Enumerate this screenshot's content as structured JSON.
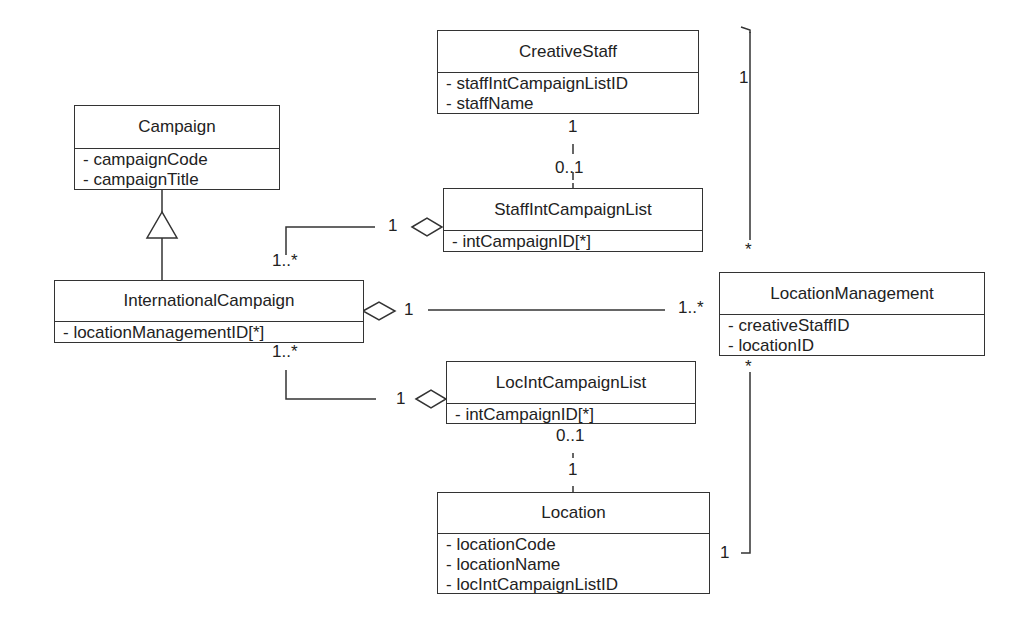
{
  "diagram": {
    "type": "UML class diagram",
    "classes": [
      {
        "id": "CreativeStaff",
        "name": "CreativeStaff",
        "attributes": [
          "- staffIntCampaignListID",
          "- staffName"
        ]
      },
      {
        "id": "Campaign",
        "name": "Campaign",
        "attributes": [
          "- campaignCode",
          "- campaignTitle"
        ]
      },
      {
        "id": "StaffIntCampaignList",
        "name": "StaffIntCampaignList",
        "attributes": [
          "- intCampaignID[*]"
        ]
      },
      {
        "id": "InternationalCampaign",
        "name": "InternationalCampaign",
        "attributes": [
          "- locationManagementID[*]"
        ]
      },
      {
        "id": "LocationManagement",
        "name": "LocationManagement",
        "attributes": [
          "- creativeStaffID",
          "- locationID"
        ]
      },
      {
        "id": "LocIntCampaignList",
        "name": "LocIntCampaignList",
        "attributes": [
          "- intCampaignID[*]"
        ]
      },
      {
        "id": "Location",
        "name": "Location",
        "attributes": [
          "- locationCode",
          "- locationName",
          "- locIntCampaignListID"
        ]
      }
    ],
    "relationships": [
      {
        "type": "generalization",
        "from": "InternationalCampaign",
        "to": "Campaign"
      },
      {
        "type": "association",
        "from": "CreativeStaff",
        "to": "StaffIntCampaignList",
        "from_mult": "1",
        "to_mult": "0..1"
      },
      {
        "type": "aggregation",
        "whole": "StaffIntCampaignList",
        "part": "InternationalCampaign",
        "whole_mult": "1",
        "part_mult": "1..*"
      },
      {
        "type": "aggregation",
        "whole": "InternationalCampaign",
        "part": "LocationManagement",
        "whole_mult": "1",
        "part_mult": "1..*"
      },
      {
        "type": "aggregation",
        "whole": "LocIntCampaignList",
        "part": "InternationalCampaign",
        "whole_mult": "1",
        "part_mult": "1..*"
      },
      {
        "type": "association",
        "from": "LocIntCampaignList",
        "to": "Location",
        "from_mult": "0..1",
        "to_mult": "1"
      },
      {
        "type": "association",
        "from": "CreativeStaff",
        "to": "LocationManagement",
        "from_mult": "1",
        "to_mult": "*"
      },
      {
        "type": "association",
        "from": "Location",
        "to": "LocationManagement",
        "from_mult": "1",
        "to_mult": "*"
      }
    ],
    "labels": {
      "cs_sicl_top": "1",
      "cs_sicl_bottom": "0..1",
      "sicl_diamond": "1",
      "ic_top": "1..*",
      "ic_diamond": "1",
      "lm_left": "1..*",
      "ic_bottom": "1..*",
      "licl_diamond": "1",
      "licl_bottom": "0..1",
      "loc_top": "1",
      "cs_right": "1",
      "lm_top": "*",
      "lm_bottom": "*",
      "loc_right": "1"
    }
  }
}
